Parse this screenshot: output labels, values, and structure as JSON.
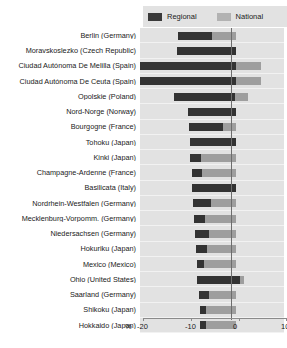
{
  "legend": {
    "regional_label": "Regional",
    "national_label": "National",
    "regional_color": "#333333",
    "national_color": "#9e9e9e"
  },
  "axis": {
    "unit_label": "%",
    "ticks": [
      "-20",
      "-10",
      "0",
      "10"
    ],
    "tick_values": [
      -20,
      -10,
      0,
      10
    ],
    "min": -20,
    "max": 10
  },
  "chart_data": {
    "type": "bar",
    "orientation": "horizontal",
    "title": "",
    "subtitle": "",
    "xlabel": "%",
    "ylabel": "",
    "xlim": [
      -20,
      10
    ],
    "grid": false,
    "legend_position": "top-right",
    "stacked_from_zero": true,
    "note": "Each row shows a dark 'Regional' bar overlaid on a lighter 'National' bar; both are measured from the 0 axis extending leftwards (negative). Values are percent changes.",
    "categories": [
      "Berlin (Germany)",
      "Moravskoslezko (Czech Republic)",
      "Ciudad Autónoma De Melilla  (Spain)",
      "Ciudad Autónoma De Ceuta (Spain)",
      "Opolskie (Poland)",
      "Nord-Norge (Norway)",
      "Bourgogne (France)",
      "Tohoku (Japan)",
      "Kinki (Japan)",
      "Champagne-Ardenne (France)",
      "Basilicata (Italy)",
      "Nordrhein-Westfalen (Germany)",
      "Mecklenburg-Vorpomm. (Germany)",
      "Niedersachsen (Germany)",
      "Hokuriku (Japan)",
      "Mexico (Mexico)",
      "Ohio (United States)",
      "Saarland (Germany)",
      "Shikoku (Japan)"
    ],
    "series": [
      {
        "name": "Regional",
        "color": "#333333",
        "values": [
          -12.0,
          -20.0,
          -20.0,
          -20.0,
          -16.0,
          -14.5,
          -11.0,
          -8.0,
          -5.0,
          -5.5,
          -11.0,
          -9.0,
          -6.0,
          -6.5,
          -5.5,
          -6.0,
          -11.0,
          1.0,
          -6.5
        ]
      },
      {
        "name": "National",
        "color": "#9e9e9e",
        "values": [
          -5.0,
          -20.0,
          5.0,
          5.0,
          3.0,
          -14.5,
          -11.0,
          -0.5,
          -0.5,
          -5.5,
          -11.0,
          -0.5,
          -0.5,
          -0.5,
          -0.5,
          -0.5,
          -0.5,
          -0.5,
          -0.5
        ]
      }
    ],
    "rows": [
      {
        "label": "Berlin (Germany)",
        "regional_start": -12.0,
        "regional_end": -5.0,
        "national_start": -5.2,
        "national_end": 0.0
      },
      {
        "label": "Moravskoslezko (Czech Republic)",
        "regional_start": -12.2,
        "regional_end": 0.0,
        "national_start": 0.0,
        "national_end": 0.0
      },
      {
        "label": "Ciudad Autónoma De Melilla  (Spain)",
        "regional_start": -20.0,
        "regional_end": 0.0,
        "national_start": 0.0,
        "national_end": 5.2
      },
      {
        "label": "Ciudad Autónoma De Ceuta (Spain)",
        "regional_start": -20.0,
        "regional_end": 0.0,
        "national_start": 0.0,
        "national_end": 5.2
      },
      {
        "label": "Opolskie (Poland)",
        "regional_start": -13.0,
        "regional_end": -0.3,
        "national_start": -0.3,
        "national_end": 2.6
      },
      {
        "label": "Nord-Norge (Norway)",
        "regional_start": -10.0,
        "regional_end": 0.0,
        "national_start": 0.0,
        "national_end": 0.0
      },
      {
        "label": "Bourgogne (France)",
        "regional_start": -9.8,
        "regional_end": -2.8,
        "national_start": -2.8,
        "national_end": 0.0
      },
      {
        "label": "Tohoku (Japan)",
        "regional_start": -9.6,
        "regional_end": 0.0,
        "national_start": 0.0,
        "national_end": 0.0
      },
      {
        "label": "Kinki (Japan)",
        "regional_start": -9.6,
        "regional_end": -7.2,
        "national_start": -7.2,
        "national_end": 0.0
      },
      {
        "label": "Champagne-Ardenne (France)",
        "regional_start": -9.2,
        "regional_end": -7.0,
        "national_start": -7.0,
        "national_end": 0.0
      },
      {
        "label": "Basilicata (Italy)",
        "regional_start": -9.2,
        "regional_end": 0.0,
        "national_start": 0.0,
        "national_end": 0.0
      },
      {
        "label": "Nordrhein-Westfalen (Germany)",
        "regional_start": -9.0,
        "regional_end": -5.2,
        "national_start": -5.2,
        "national_end": 0.0
      },
      {
        "label": "Mecklenburg-Vorpomm. (Germany)",
        "regional_start": -8.8,
        "regional_end": -6.4,
        "national_start": -6.4,
        "national_end": 0.0
      },
      {
        "label": "Niedersachsen (Germany)",
        "regional_start": -8.6,
        "regional_end": -5.6,
        "national_start": -5.6,
        "national_end": 0.0
      },
      {
        "label": "Hokuriku (Japan)",
        "regional_start": -8.4,
        "regional_end": -6.0,
        "national_start": -6.0,
        "national_end": 0.0
      },
      {
        "label": "Mexico (Mexico)",
        "regional_start": -8.2,
        "regional_end": -6.6,
        "national_start": -6.6,
        "national_end": 0.0
      },
      {
        "label": "Ohio (United States)",
        "regional_start": -8.2,
        "regional_end": 0.9,
        "national_start": 0.9,
        "national_end": 1.6
      },
      {
        "label": "Saarland (Germany)",
        "regional_start": -7.8,
        "regional_end": -5.6,
        "national_start": -5.6,
        "national_end": 0.0
      },
      {
        "label": "Shikoku (Japan)",
        "regional_start": -7.6,
        "regional_end": -6.2,
        "national_start": -6.2,
        "national_end": 0.0
      },
      {
        "label": "Hokkaido (Japan)",
        "regional_start": -7.6,
        "regional_end": -6.2,
        "national_start": -6.2,
        "national_end": 0.0
      }
    ]
  }
}
